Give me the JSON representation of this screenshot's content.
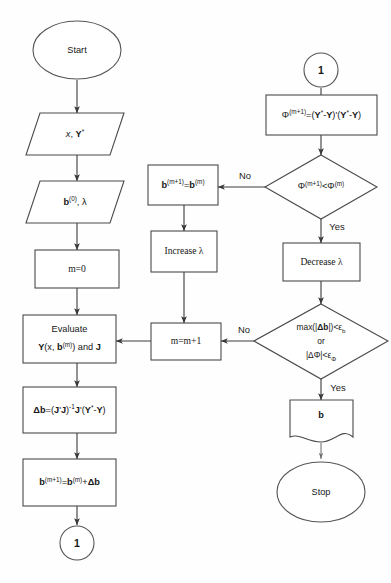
{
  "diagram": {
    "stroke_color": "#4a4a4a",
    "text_color": "#161616",
    "background": "#fefefe"
  },
  "nodes": {
    "start": {
      "label": "Start",
      "shape": "terminator"
    },
    "input_xy": {
      "label": "x, Y*",
      "shape": "parallelogram-io"
    },
    "input_b0": {
      "label": "b(0), λ",
      "shape": "parallelogram-io"
    },
    "m_init": {
      "label": "m=0",
      "shape": "process"
    },
    "evaluate": {
      "label_line1": "Evaluate",
      "label_line2": "Y(x, b(m)) and J",
      "shape": "process"
    },
    "delta_b": {
      "label": "Δb=(J'J)-1J'(Y*-Y)",
      "shape": "process"
    },
    "b_update": {
      "label": "b(m+1)=b(m)+Δb",
      "shape": "process"
    },
    "connector_bottom_left": {
      "label": "1",
      "shape": "connector"
    },
    "connector_top_right": {
      "label": "1",
      "shape": "connector"
    },
    "phi_calc": {
      "label": "Φ(m+1)=(Y*-Y)'(Y*-Y)",
      "shape": "process"
    },
    "phi_decision": {
      "label": "Φ(m+1)<Φ(m)",
      "shape": "decision"
    },
    "b_revert": {
      "label": "b(m+1)=b(m)",
      "shape": "process"
    },
    "increase_lambda": {
      "label": "Increase λ",
      "shape": "process"
    },
    "m_increment": {
      "label": "m=m+1",
      "shape": "process"
    },
    "decrease_lambda": {
      "label": "Decrease λ",
      "shape": "process"
    },
    "converge_decision": {
      "label_line1": "max(|Δb|)<εb",
      "label_line2": "or",
      "label_line3": "|ΔΦ|<εΦ",
      "shape": "decision"
    },
    "output_b": {
      "label": "b",
      "shape": "document"
    },
    "stop": {
      "label": "Stop",
      "shape": "terminator"
    }
  },
  "edge_labels": {
    "phi_no": "No",
    "phi_yes": "Yes",
    "converge_no": "No",
    "converge_yes": "Yes"
  }
}
